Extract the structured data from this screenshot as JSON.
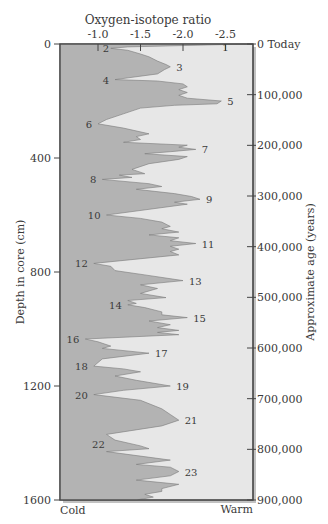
{
  "chart_data": {
    "type": "area",
    "title": "Oxygen-isotope ratio",
    "xlabel": "Oxygen-isotope ratio",
    "ylabel_left": "Depth in core (cm)",
    "ylabel_right": "Approximate age (years)",
    "x_ticks": [
      "-1.0",
      "-1.5",
      "-2.0",
      "-2.5"
    ],
    "x_tick_values": [
      -1.0,
      -1.5,
      -2.0,
      -2.5
    ],
    "x_range": [
      -0.55,
      -2.82
    ],
    "left_ticks": [
      "0",
      "400",
      "800",
      "1200",
      "1600"
    ],
    "left_tick_values": [
      0,
      400,
      800,
      1200,
      1600
    ],
    "right_ticks": [
      "0 Today",
      "100,000",
      "200,000",
      "300,000",
      "400,000",
      "500,000",
      "600,000",
      "700,000",
      "800,000",
      "900,000"
    ],
    "right_tick_values": [
      0,
      100000,
      200000,
      300000,
      400000,
      500000,
      600000,
      700000,
      800000,
      900000
    ],
    "depth_range": [
      0,
      1600
    ],
    "age_range": [
      0,
      900000
    ],
    "bottom_left_label": "Cold",
    "bottom_right_label": "Warm",
    "grid": false,
    "stages": [
      {
        "label": "1",
        "value": -2.5,
        "depth": 10
      },
      {
        "label": "2",
        "value": -1.2,
        "depth": 15
      },
      {
        "label": "3",
        "value": -1.85,
        "depth": 80
      },
      {
        "label": "4",
        "value": -1.2,
        "depth": 125
      },
      {
        "label": "5",
        "value": -2.45,
        "depth": 200
      },
      {
        "label": "6",
        "value": -1.0,
        "depth": 280
      },
      {
        "label": "7",
        "value": -2.15,
        "depth": 370
      },
      {
        "label": "8",
        "value": -1.05,
        "depth": 475
      },
      {
        "label": "9",
        "value": -2.2,
        "depth": 545
      },
      {
        "label": "10",
        "value": -1.1,
        "depth": 600
      },
      {
        "label": "11",
        "value": -2.15,
        "depth": 700
      },
      {
        "label": "12",
        "value": -0.95,
        "depth": 770
      },
      {
        "label": "13",
        "value": -2.0,
        "depth": 830
      },
      {
        "label": "14",
        "value": -1.35,
        "depth": 915
      },
      {
        "label": "15",
        "value": -2.05,
        "depth": 960
      },
      {
        "label": "16",
        "value": -0.85,
        "depth": 1035
      },
      {
        "label": "17",
        "value": -1.6,
        "depth": 1085
      },
      {
        "label": "18",
        "value": -0.95,
        "depth": 1130
      },
      {
        "label": "19",
        "value": -1.85,
        "depth": 1200
      },
      {
        "label": "20",
        "value": -0.95,
        "depth": 1230
      },
      {
        "label": "21",
        "value": -1.95,
        "depth": 1320
      },
      {
        "label": "22",
        "value": -1.15,
        "depth": 1405
      },
      {
        "label": "23",
        "value": -1.95,
        "depth": 1500
      }
    ],
    "curve": [
      [
        -2.75,
        0
      ],
      [
        -1.35,
        10
      ],
      [
        -1.15,
        15
      ],
      [
        -1.35,
        22
      ],
      [
        -1.5,
        35
      ],
      [
        -1.6,
        45
      ],
      [
        -1.7,
        60
      ],
      [
        -1.8,
        72
      ],
      [
        -1.85,
        80
      ],
      [
        -1.78,
        90
      ],
      [
        -1.7,
        105
      ],
      [
        -1.2,
        125
      ],
      [
        -1.7,
        130
      ],
      [
        -2.0,
        140
      ],
      [
        -2.05,
        150
      ],
      [
        -1.95,
        160
      ],
      [
        -2.05,
        170
      ],
      [
        -1.95,
        180
      ],
      [
        -2.05,
        190
      ],
      [
        -2.45,
        200
      ],
      [
        -2.4,
        210
      ],
      [
        -1.9,
        215
      ],
      [
        -1.5,
        225
      ],
      [
        -1.3,
        245
      ],
      [
        -1.1,
        265
      ],
      [
        -1.0,
        280
      ],
      [
        -1.3,
        295
      ],
      [
        -1.6,
        315
      ],
      [
        -1.45,
        325
      ],
      [
        -1.5,
        335
      ],
      [
        -1.3,
        345
      ],
      [
        -2.05,
        355
      ],
      [
        -1.95,
        362
      ],
      [
        -2.15,
        370
      ],
      [
        -1.85,
        378
      ],
      [
        -1.55,
        385
      ],
      [
        -2.05,
        395
      ],
      [
        -1.95,
        405
      ],
      [
        -1.6,
        420
      ],
      [
        -1.4,
        440
      ],
      [
        -1.55,
        455
      ],
      [
        -1.25,
        460
      ],
      [
        -1.4,
        468
      ],
      [
        -1.05,
        475
      ],
      [
        -1.6,
        490
      ],
      [
        -1.75,
        500
      ],
      [
        -1.45,
        510
      ],
      [
        -1.9,
        525
      ],
      [
        -2.1,
        535
      ],
      [
        -2.2,
        545
      ],
      [
        -1.9,
        555
      ],
      [
        -2.05,
        562
      ],
      [
        -1.1,
        600
      ],
      [
        -1.5,
        612
      ],
      [
        -1.75,
        625
      ],
      [
        -1.85,
        640
      ],
      [
        -1.75,
        648
      ],
      [
        -1.95,
        660
      ],
      [
        -1.6,
        670
      ],
      [
        -1.95,
        680
      ],
      [
        -1.85,
        690
      ],
      [
        -2.15,
        700
      ],
      [
        -1.85,
        710
      ],
      [
        -1.95,
        720
      ],
      [
        -1.85,
        728
      ],
      [
        -1.95,
        740
      ],
      [
        -0.95,
        770
      ],
      [
        -1.15,
        780
      ],
      [
        -1.2,
        795
      ],
      [
        -1.55,
        810
      ],
      [
        -2.0,
        830
      ],
      [
        -1.5,
        845
      ],
      [
        -1.7,
        858
      ],
      [
        -1.5,
        875
      ],
      [
        -1.8,
        890
      ],
      [
        -1.35,
        900
      ],
      [
        -1.45,
        910
      ],
      [
        -1.35,
        915
      ],
      [
        -1.55,
        925
      ],
      [
        -1.75,
        940
      ],
      [
        -1.75,
        950
      ],
      [
        -2.05,
        960
      ],
      [
        -1.6,
        972
      ],
      [
        -1.85,
        985
      ],
      [
        -1.7,
        995
      ],
      [
        -1.95,
        1005
      ],
      [
        -1.7,
        1012
      ],
      [
        -1.95,
        1020
      ],
      [
        -0.85,
        1035
      ],
      [
        -1.0,
        1045
      ],
      [
        -1.15,
        1060
      ],
      [
        -1.05,
        1068
      ],
      [
        -1.6,
        1085
      ],
      [
        -1.05,
        1105
      ],
      [
        -0.95,
        1130
      ],
      [
        -1.3,
        1140
      ],
      [
        -1.5,
        1150
      ],
      [
        -1.2,
        1165
      ],
      [
        -1.45,
        1180
      ],
      [
        -1.85,
        1200
      ],
      [
        -1.3,
        1215
      ],
      [
        -0.95,
        1230
      ],
      [
        -1.5,
        1250
      ],
      [
        -1.75,
        1280
      ],
      [
        -1.85,
        1300
      ],
      [
        -1.95,
        1320
      ],
      [
        -1.75,
        1340
      ],
      [
        -1.1,
        1370
      ],
      [
        -1.2,
        1390
      ],
      [
        -1.5,
        1410
      ],
      [
        -1.6,
        1420
      ],
      [
        -1.1,
        1430
      ],
      [
        -1.85,
        1460
      ],
      [
        -1.45,
        1475
      ],
      [
        -1.85,
        1485
      ],
      [
        -1.95,
        1500
      ],
      [
        -1.85,
        1515
      ],
      [
        -1.45,
        1530
      ],
      [
        -1.95,
        1545
      ],
      [
        -1.75,
        1560
      ],
      [
        -1.75,
        1570
      ],
      [
        -1.55,
        1580
      ],
      [
        -1.65,
        1590
      ],
      [
        -1.45,
        1600
      ]
    ]
  }
}
